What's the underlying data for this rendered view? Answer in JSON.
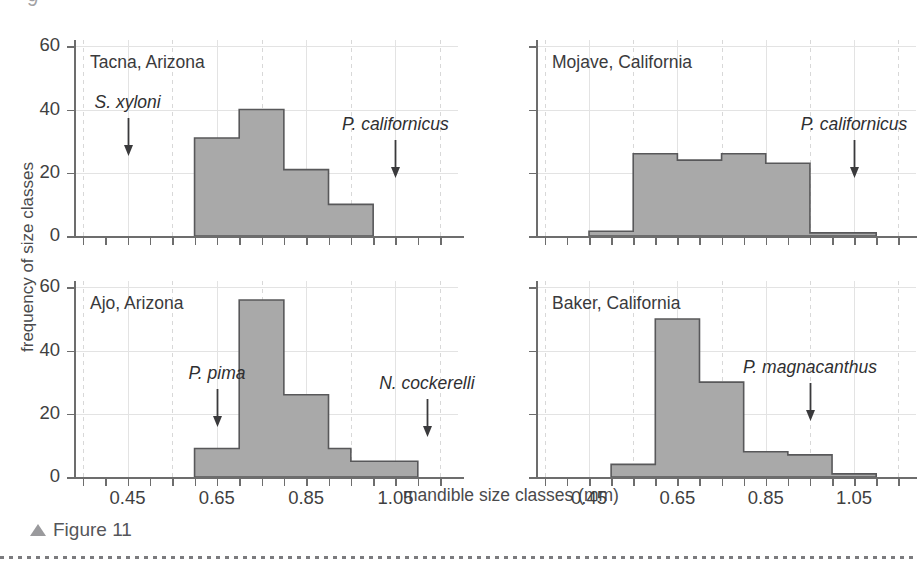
{
  "figure": {
    "caption": "Figure 11",
    "caption_marker": "triangle-up",
    "top_clipped_glyph": "9"
  },
  "axes": {
    "xlabel": "mandible size classes (mm)",
    "ylabel": "frequency of size classes",
    "ytick_labels": [
      "0",
      "20",
      "40",
      "60"
    ],
    "ytick_values": [
      0,
      20,
      40,
      60
    ],
    "ylim": [
      0,
      62
    ],
    "xtick_labels": [
      "0.45",
      "0.65",
      "0.85",
      "1.05"
    ],
    "xtick_values": [
      0.45,
      0.65,
      0.85,
      1.05
    ],
    "xlim": [
      0.33,
      1.19
    ],
    "grid": "vertical solid at major ticks, vertical dashed between, horizontal solid at y ticks"
  },
  "colors": {
    "bar_fill": "#a9a9a9",
    "bar_stroke": "#58585a",
    "axis": "#6d6d6d",
    "grid_solid": "#e3e3e3",
    "grid_dashed": "#d8d8d8",
    "text": "#3a3a3c",
    "caption": "#55565a"
  },
  "chart_data": {
    "type": "bar",
    "title": "",
    "xlabel": "mandible size classes (mm)",
    "ylabel": "frequency of size classes",
    "xlim": [
      0.33,
      1.19
    ],
    "ylim": [
      0,
      62
    ],
    "bin_width": 0.05,
    "panels": [
      {
        "id": "tacna",
        "name": "Tacna, Arizona",
        "position": "top-left",
        "bin_starts": [
          0.6,
          0.65,
          0.7,
          0.75,
          0.8,
          0.85,
          0.9,
          0.95
        ],
        "values": [
          31,
          31,
          40,
          40,
          21,
          21,
          10,
          10
        ],
        "annotations": [
          {
            "label": "S. xyloni",
            "x": 0.45,
            "arrow": "down"
          },
          {
            "label": "P. californicus",
            "x": 1.05,
            "arrow": "down"
          }
        ]
      },
      {
        "id": "mojave",
        "name": "Mojave, California",
        "position": "top-right",
        "bin_starts": [
          0.45,
          0.5,
          0.55,
          0.6,
          0.65,
          0.7,
          0.75,
          0.8,
          0.85,
          0.9,
          0.95,
          1.0,
          1.05
        ],
        "values": [
          1.5,
          1.5,
          26,
          26,
          24,
          24,
          26,
          26,
          23,
          23,
          1,
          1,
          1
        ],
        "annotations": [
          {
            "label": "P. californicus",
            "x": 1.05,
            "arrow": "down"
          }
        ]
      },
      {
        "id": "ajo",
        "name": "Ajo, Arizona",
        "position": "bottom-left",
        "bin_starts": [
          0.6,
          0.65,
          0.7,
          0.75,
          0.8,
          0.85,
          0.9,
          0.95,
          1.0,
          1.05
        ],
        "values": [
          9,
          9,
          56,
          56,
          26,
          26,
          9,
          5,
          5,
          5
        ],
        "annotations": [
          {
            "label": "P. pima",
            "x": 0.65,
            "arrow": "down"
          },
          {
            "label": "N. cockerelli",
            "x": 1.12,
            "arrow": "down"
          }
        ]
      },
      {
        "id": "baker",
        "name": "Baker, California",
        "position": "bottom-right",
        "bin_starts": [
          0.5,
          0.55,
          0.6,
          0.65,
          0.7,
          0.75,
          0.8,
          0.85,
          0.9,
          0.95,
          1.0,
          1.05
        ],
        "values": [
          4,
          4,
          50,
          50,
          30,
          30,
          8,
          8,
          7,
          7,
          1,
          1
        ],
        "annotations": [
          {
            "label": "P. magnacanthus",
            "x": 0.95,
            "arrow": "down"
          }
        ]
      }
    ]
  }
}
